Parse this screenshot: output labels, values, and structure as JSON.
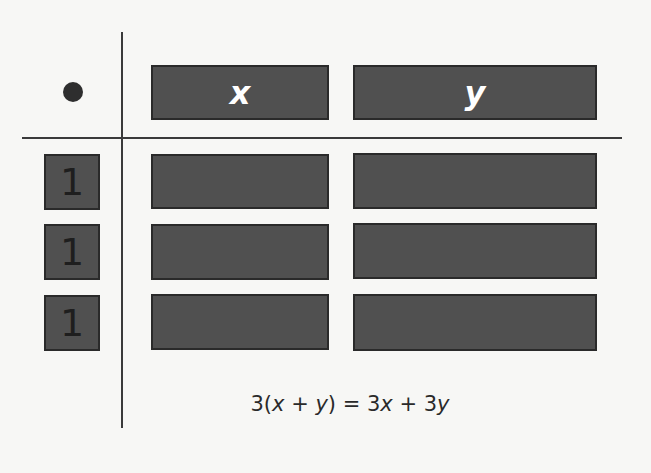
{
  "diagram": {
    "corner_symbol": "multiplication-dot",
    "header_tiles": [
      {
        "label": "x",
        "kind": "x-tile"
      },
      {
        "label": "y",
        "kind": "y-tile"
      }
    ],
    "row_factors": [
      {
        "label": "1",
        "kind": "unit-tile"
      },
      {
        "label": "1",
        "kind": "unit-tile"
      },
      {
        "label": "1",
        "kind": "unit-tile"
      }
    ],
    "product_grid": {
      "rows": 3,
      "columns": [
        "x",
        "y"
      ],
      "cells": [
        [
          "x",
          "y"
        ],
        [
          "x",
          "y"
        ],
        [
          "x",
          "y"
        ]
      ]
    },
    "equation": {
      "parts": [
        "3(",
        "x",
        " + ",
        "y",
        ") = 3",
        "x",
        " + 3",
        "y"
      ],
      "full_text": "3(x + y) = 3x + 3y"
    },
    "colors": {
      "background": "#f7f7f5",
      "tile_fill": "#505050",
      "tile_border": "#2a2a2a",
      "lines": "#3a3a3a",
      "header_text": "#ffffff",
      "unit_text": "#1e1e1e"
    }
  }
}
